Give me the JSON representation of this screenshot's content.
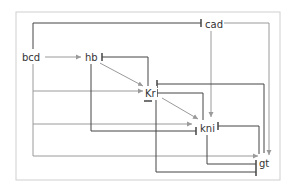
{
  "diagram": {
    "title": "",
    "frame_color": "#c8c8c8",
    "activation_color": "#9a9a9a",
    "repression_color": "#444444",
    "nodes": [
      {
        "id": "bcd",
        "label": "bcd",
        "x": 31,
        "y": 58
      },
      {
        "id": "hb",
        "label": "hb",
        "x": 94,
        "y": 58
      },
      {
        "id": "cad",
        "label": "cad",
        "x": 203,
        "y": 25
      },
      {
        "id": "Kr",
        "label": "Kr",
        "x": 152,
        "y": 93
      },
      {
        "id": "kni",
        "label": "kni",
        "x": 209,
        "y": 128
      },
      {
        "id": "gt",
        "label": "gt",
        "x": 262,
        "y": 162
      }
    ],
    "edges": [
      {
        "from": "bcd",
        "to": "hb",
        "type": "activation"
      },
      {
        "from": "bcd",
        "to": "cad",
        "type": "repression"
      },
      {
        "from": "bcd",
        "to": "Kr",
        "type": "activation"
      },
      {
        "from": "bcd",
        "to": "kni",
        "type": "activation"
      },
      {
        "from": "bcd",
        "to": "gt",
        "type": "activation"
      },
      {
        "from": "hb",
        "to": "Kr",
        "type": "activation"
      },
      {
        "from": "hb",
        "to": "kni",
        "type": "repression"
      },
      {
        "from": "hb",
        "to": "gt",
        "type": "repression"
      },
      {
        "from": "cad",
        "to": "kni",
        "type": "activation"
      },
      {
        "from": "cad",
        "to": "gt",
        "type": "activation"
      },
      {
        "from": "Kr",
        "to": "hb",
        "type": "repression"
      },
      {
        "from": "Kr",
        "to": "kni",
        "type": "activation"
      },
      {
        "from": "Kr",
        "to": "gt",
        "type": "repression"
      },
      {
        "from": "kni",
        "to": "Kr",
        "type": "repression"
      },
      {
        "from": "kni",
        "to": "gt",
        "type": "repression"
      },
      {
        "from": "gt",
        "to": "Kr",
        "type": "repression"
      },
      {
        "from": "gt",
        "to": "kni",
        "type": "repression"
      }
    ]
  }
}
